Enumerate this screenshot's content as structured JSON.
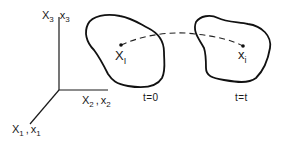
{
  "diagram": {
    "axes": {
      "vertical": {
        "material_base": "X",
        "material_sub": "3",
        "separator": "|",
        "spatial_base": "x",
        "spatial_sub": "3"
      },
      "horizontal": {
        "material_base": "X",
        "material_sub": "2",
        "separator": ",",
        "spatial_base": "x",
        "spatial_sub": "2"
      },
      "diagonal": {
        "material_base": "X",
        "material_sub": "1",
        "separator": ",",
        "spatial_base": "x",
        "spatial_sub": "1"
      }
    },
    "reference_configuration": {
      "point_base": "X",
      "point_sub": "I",
      "time_label": "t=0"
    },
    "current_configuration": {
      "point_base": "x",
      "point_sub": "i",
      "time_label": "t=t"
    },
    "trajectory": {
      "style": "dashed"
    },
    "colors": {
      "ink": "#111111",
      "background": "#ffffff"
    }
  }
}
